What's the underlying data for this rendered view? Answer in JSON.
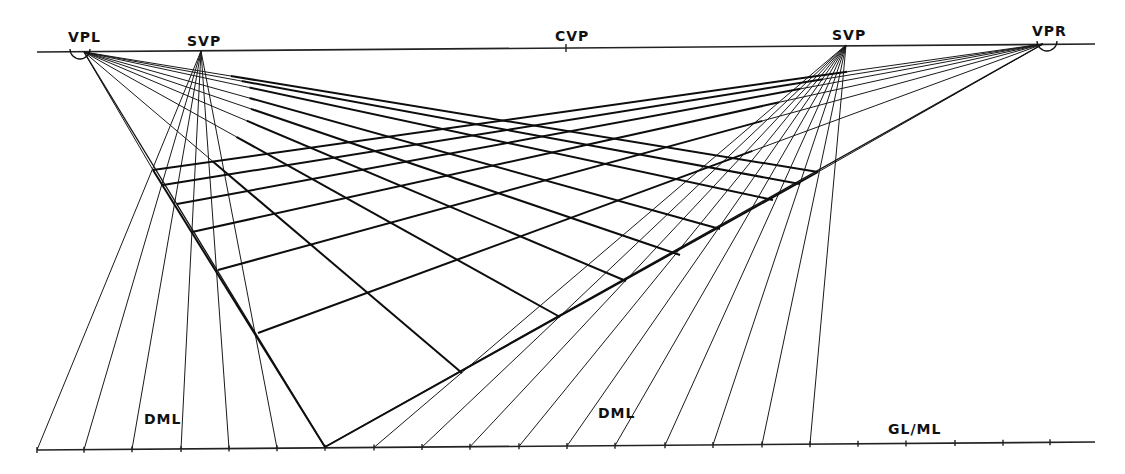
{
  "diagram": {
    "type": "two-point perspective grid construction",
    "colors": {
      "ink": "#111111",
      "background": "#ffffff"
    },
    "horizon_line": {
      "x1": 37,
      "y1": 52,
      "x2": 1095,
      "y2": 44
    },
    "ground_line": {
      "x1": 37,
      "y1": 450,
      "x2": 1095,
      "y2": 442,
      "label": "GL/ML",
      "label_pos": [
        888,
        433
      ]
    },
    "points": {
      "vpl": {
        "label": "VPL",
        "x": 84,
        "y": 52,
        "label_pos": [
          70,
          40
        ],
        "circled": true
      },
      "svp_left": {
        "label": "SVP",
        "x": 201,
        "y": 51,
        "label_pos": [
          188,
          46
        ]
      },
      "cvp": {
        "label": "CVP",
        "x": 566,
        "y": 48,
        "label_pos": [
          555,
          40
        ]
      },
      "svp_right": {
        "label": "SVP",
        "x": 846,
        "y": 45,
        "label_pos": [
          832,
          40
        ]
      },
      "vpr": {
        "label": "VPR",
        "x": 1043,
        "y": 44,
        "label_pos": [
          1033,
          35
        ],
        "circled": true
      }
    },
    "dml_labels": [
      {
        "text": "DML",
        "x": 144,
        "y": 424
      },
      {
        "text": "DML",
        "x": 598,
        "y": 417
      }
    ],
    "near_corner": {
      "x": 325,
      "y": 447
    },
    "ground_ticks_x": [
      37,
      84,
      132,
      181,
      229,
      277,
      325,
      374,
      422,
      470,
      519,
      567,
      615,
      665,
      713,
      762,
      810,
      858,
      906,
      955,
      1003,
      1050
    ],
    "left_edge_points": [
      [
        153,
        170
      ],
      [
        163,
        185
      ],
      [
        177,
        204
      ],
      [
        192,
        232
      ],
      [
        218,
        270
      ],
      [
        258,
        333
      ],
      [
        325,
        447
      ]
    ],
    "right_edge_points": [
      [
        325,
        447
      ],
      [
        462,
        373
      ],
      [
        560,
        317
      ],
      [
        626,
        281
      ],
      [
        680,
        255
      ],
      [
        720,
        229
      ],
      [
        773,
        200
      ],
      [
        800,
        184
      ],
      [
        818,
        172
      ]
    ],
    "left_dml_ticks": [
      37,
      84,
      132,
      181,
      229,
      277
    ],
    "right_dml_ticks": [
      374,
      422,
      470,
      519,
      567,
      615,
      665,
      713,
      762,
      810
    ]
  }
}
